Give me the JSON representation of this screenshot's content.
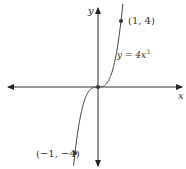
{
  "chart_data": {
    "type": "line",
    "title": "",
    "xlabel": "x",
    "ylabel": "y",
    "function_label": "y = 4x³",
    "equation": "y = 4x^3",
    "series": [
      {
        "name": "y = 4x^3",
        "x": [
          -1.1,
          -1,
          -0.75,
          -0.5,
          -0.25,
          0,
          0.25,
          0.5,
          0.75,
          1,
          1.1
        ],
        "values": [
          -5.324,
          -4,
          -1.6875,
          -0.5,
          -0.0625,
          0,
          0.0625,
          0.5,
          1.6875,
          4,
          5.324
        ]
      }
    ],
    "points": [
      {
        "label": "(1, 4)",
        "x": 1,
        "y": 4
      },
      {
        "label": "(-1, -4)",
        "x": -1,
        "y": -4
      },
      {
        "label": "origin",
        "x": 0,
        "y": 0
      }
    ],
    "grid": false,
    "axes_arrows": true
  },
  "labels": {
    "x_axis": "x",
    "y_axis": "y",
    "func": "y = 4x",
    "func_exp": "3",
    "p1": "(1, 4)",
    "p2": "(−1, −4)"
  }
}
